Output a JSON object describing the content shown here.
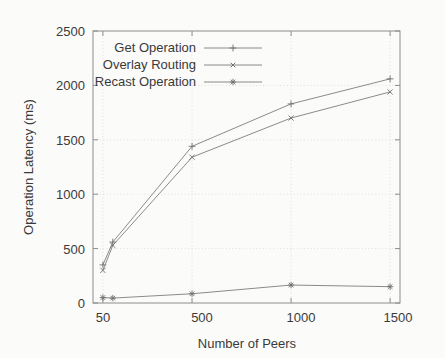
{
  "chart_data": {
    "type": "line",
    "title": "",
    "xlabel": "Number of Peers",
    "ylabel": "Operation Latency (ms)",
    "xlim": [
      0,
      1550
    ],
    "ylim": [
      0,
      2500
    ],
    "xticks": [
      50,
      500,
      1000,
      1500
    ],
    "xticklabels": [
      "50",
      "500",
      "1000",
      "1500"
    ],
    "yticks": [
      0,
      500,
      1000,
      1500,
      2000,
      2500
    ],
    "yticklabels": [
      "0",
      "500",
      "1000",
      "1500",
      "2000",
      "2500"
    ],
    "grid": true,
    "legend_position": "upper left",
    "series": [
      {
        "name": "Get Operation",
        "marker": "plus",
        "x": [
          50,
          100,
          500,
          1000,
          1500
        ],
        "y": [
          350,
          560,
          1440,
          1830,
          2060
        ]
      },
      {
        "name": "Overlay Routing",
        "marker": "cross",
        "x": [
          50,
          100,
          500,
          1000,
          1500
        ],
        "y": [
          300,
          530,
          1340,
          1700,
          1940
        ]
      },
      {
        "name": "Recast Operation",
        "marker": "star",
        "x": [
          50,
          100,
          500,
          1000,
          1500
        ],
        "y": [
          50,
          45,
          85,
          165,
          150
        ]
      }
    ]
  },
  "legend": {
    "entries": [
      {
        "label": "Get Operation"
      },
      {
        "label": "Overlay Routing"
      },
      {
        "label": "Recast Operation"
      }
    ]
  },
  "axes": {
    "x_title": "Number of Peers",
    "y_title": "Operation Latency (ms)"
  },
  "colors": {
    "background": "#fbfbfa",
    "axis": "#8c8c8c",
    "text": "#3a3a3a",
    "series": "#7e7e7e",
    "grid": "#d8d8d8"
  }
}
